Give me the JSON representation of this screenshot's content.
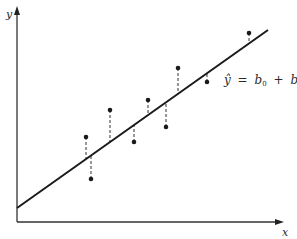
{
  "figure": {
    "type": "regression-residuals-diagram",
    "axis_labels": {
      "x": "x",
      "y": "y"
    },
    "equation": {
      "yhat": "ŷ",
      "equals": "=",
      "b0": "b",
      "b0_sub": "0",
      "plus": "+",
      "b1": "b",
      "b1_sub": "1",
      "x": "x"
    },
    "colors": {
      "line": "#1a1a1a",
      "axis": "#333333",
      "point": "#1a1a1a",
      "residual": "#333333"
    }
  },
  "chart_data": {
    "type": "scatter",
    "title": "",
    "xlabel": "x",
    "ylabel": "y",
    "grid": false,
    "regression_line": {
      "label": "ŷ = b0 + b1x",
      "x0": 17,
      "y0": 208,
      "x1": 268,
      "y1": 30
    },
    "points_pixel": [
      {
        "x": 86,
        "y": 137,
        "fit_y": 159
      },
      {
        "x": 91,
        "y": 179,
        "fit_y": 155
      },
      {
        "x": 110,
        "y": 110,
        "fit_y": 142
      },
      {
        "x": 134,
        "y": 142,
        "fit_y": 125
      },
      {
        "x": 148,
        "y": 100,
        "fit_y": 115
      },
      {
        "x": 166,
        "y": 127,
        "fit_y": 102
      },
      {
        "x": 178,
        "y": 68,
        "fit_y": 94
      },
      {
        "x": 207,
        "y": 82,
        "fit_y": 73
      },
      {
        "x": 249,
        "y": 33,
        "fit_y": 43
      }
    ]
  }
}
